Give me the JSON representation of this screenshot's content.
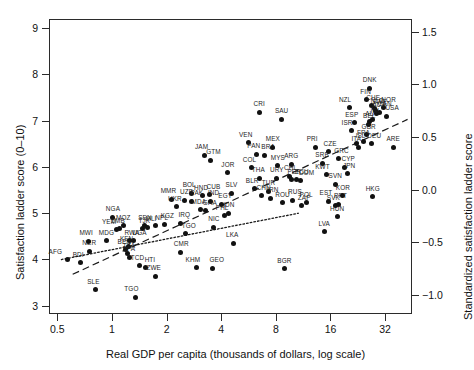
{
  "chart_data": {
    "type": "scatter",
    "title": "",
    "xlabel": "Real GDP per capita (thousands of dollars, log scale)",
    "ylabel": "Satisfaction ladder score (0–10)",
    "ylabel_right": "Standardized satisfaction ladder score",
    "x_scale": "log2",
    "xlim": [
      0.45,
      45
    ],
    "ylim": [
      2.82,
      9.2
    ],
    "ylim_right": [
      -1.18,
      1.62
    ],
    "xticks": [
      0.5,
      1,
      2,
      4,
      8,
      16,
      32
    ],
    "xtick_labels": [
      "0.5",
      "1",
      "2",
      "4",
      "8",
      "16",
      "32"
    ],
    "yticks": [
      3,
      4,
      5,
      6,
      7,
      8,
      9
    ],
    "ytick_labels": [
      "3",
      "4",
      "5",
      "6",
      "7",
      "8",
      "9"
    ],
    "yticks_right": [
      -1.0,
      -0.5,
      0.0,
      0.5,
      1.0,
      1.5
    ],
    "ytick_labels_right": [
      "−1.0",
      "−0.5",
      "0.0",
      "0.5",
      "1.0",
      "1.5"
    ],
    "grid": false,
    "legend": "none",
    "marker": {
      "shape": "circle",
      "color": "#111111",
      "size": 5
    },
    "fit_lines": [
      {
        "name": "dashed-fit",
        "style": "dashed",
        "x0": 0.6,
        "y0": 3.7,
        "x1": 42.0,
        "y1": 7.05
      },
      {
        "name": "dotted-fit",
        "style": "dotted",
        "x0": 0.52,
        "y0": 4.02,
        "x1": 10.5,
        "y1": 5.02
      }
    ],
    "points": [
      {
        "label": "AFG",
        "x": 0.56,
        "y": 4.02,
        "lx": -12,
        "ly": -5
      },
      {
        "label": "BDI",
        "x": 0.66,
        "y": 3.95,
        "lx": -2,
        "ly": -5
      },
      {
        "label": "NER",
        "x": 0.74,
        "y": 4.2,
        "lx": 0,
        "ly": -5
      },
      {
        "label": "MWI",
        "x": 0.73,
        "y": 4.42,
        "lx": -2,
        "ly": -5
      },
      {
        "label": "SLE",
        "x": 0.8,
        "y": 3.37,
        "lx": -2,
        "ly": -5
      },
      {
        "label": "MDG",
        "x": 0.92,
        "y": 4.43,
        "lx": 0,
        "ly": -5
      },
      {
        "label": "ZWE",
        "x": 1.72,
        "y": 3.66,
        "lx": -2,
        "ly": -5
      },
      {
        "label": "TGO",
        "x": 1.33,
        "y": 3.2,
        "lx": -4,
        "ly": -5
      },
      {
        "label": "MOZ",
        "x": 1.14,
        "y": 4.75,
        "lx": 0,
        "ly": -5
      },
      {
        "label": "NGA",
        "x": 1.0,
        "y": 4.93,
        "lx": 0,
        "ly": -5
      },
      {
        "label": "ZMB",
        "x": 1.08,
        "y": 4.68,
        "lx": -1,
        "ly": -5
      },
      {
        "label": "YEM",
        "x": 1.04,
        "y": 4.66,
        "lx": -7,
        "ly": -5
      },
      {
        "label": "RWA",
        "x": 1.24,
        "y": 4.43,
        "lx": 2,
        "ly": -5
      },
      {
        "label": "UGA",
        "x": 1.3,
        "y": 4.43,
        "lx": 6,
        "ly": -5
      },
      {
        "label": "KEN",
        "x": 1.22,
        "y": 4.3,
        "lx": -2,
        "ly": -5
      },
      {
        "label": "BEN",
        "x": 1.17,
        "y": 4.23,
        "lx": -1,
        "ly": -5
      },
      {
        "label": "TZA",
        "x": 1.21,
        "y": 4.15,
        "lx": 1,
        "ly": -5
      },
      {
        "label": "BFA",
        "x": 1.24,
        "y": 4.07,
        "lx": -1,
        "ly": -5
      },
      {
        "label": "TCD",
        "x": 1.4,
        "y": 3.88,
        "lx": -2,
        "ly": -5
      },
      {
        "label": "HTI",
        "x": 1.52,
        "y": 3.84,
        "lx": 4,
        "ly": -5
      },
      {
        "label": "SEN",
        "x": 1.5,
        "y": 4.75,
        "lx": 0,
        "ly": -5
      },
      {
        "label": "MLI",
        "x": 1.56,
        "y": 4.72,
        "lx": 3,
        "ly": -5
      },
      {
        "label": "JAM",
        "x": 3.2,
        "y": 6.28,
        "lx": -3,
        "ly": -5
      },
      {
        "label": "GTM",
        "x": 3.45,
        "y": 6.17,
        "lx": 3,
        "ly": -5
      },
      {
        "label": "JOR",
        "x": 4.3,
        "y": 5.9,
        "lx": 0,
        "ly": -5
      },
      {
        "label": "BOL",
        "x": 2.7,
        "y": 5.45,
        "lx": -2,
        "ly": -5
      },
      {
        "label": "CUB",
        "x": 3.4,
        "y": 5.42,
        "lx": 4,
        "ly": -5
      },
      {
        "label": "HND",
        "x": 3.1,
        "y": 5.4,
        "lx": -1,
        "ly": -5
      },
      {
        "label": "SLV",
        "x": 4.5,
        "y": 5.45,
        "lx": 0,
        "ly": -5
      },
      {
        "label": "MMR",
        "x": 2.1,
        "y": 5.32,
        "lx": -3,
        "ly": -5
      },
      {
        "label": "UZB",
        "x": 2.48,
        "y": 5.3,
        "lx": 2,
        "ly": -5
      },
      {
        "label": "PAK",
        "x": 2.72,
        "y": 5.28,
        "lx": 5,
        "ly": -5
      },
      {
        "label": "UKR",
        "x": 2.25,
        "y": 5.16,
        "lx": -2,
        "ly": -5
      },
      {
        "label": "IND",
        "x": 3.45,
        "y": 5.28,
        "lx": 3,
        "ly": -5
      },
      {
        "label": "EGY",
        "x": 3.95,
        "y": 5.22,
        "lx": 4,
        "ly": -5
      },
      {
        "label": "MDA",
        "x": 3.05,
        "y": 5.1,
        "lx": -2,
        "ly": -5
      },
      {
        "label": "GHA",
        "x": 3.25,
        "y": 5.08,
        "lx": 4,
        "ly": -5
      },
      {
        "label": "IDN",
        "x": 4.35,
        "y": 5.02,
        "lx": 0,
        "ly": -5
      },
      {
        "label": "PHL",
        "x": 4.1,
        "y": 4.97,
        "lx": -2,
        "ly": -5
      },
      {
        "label": "NIC",
        "x": 3.6,
        "y": 4.72,
        "lx": 0,
        "ly": -5
      },
      {
        "label": "IRQ",
        "x": 2.35,
        "y": 4.8,
        "lx": 4,
        "ly": -5
      },
      {
        "label": "NPL",
        "x": 1.72,
        "y": 4.75,
        "lx": 6,
        "ly": -5
      },
      {
        "label": "KGZ",
        "x": 1.92,
        "y": 4.78,
        "lx": 3,
        "ly": -5
      },
      {
        "label": "TJK",
        "x": 1.45,
        "y": 4.68,
        "lx": 2,
        "ly": -5
      },
      {
        "label": "TGO2",
        "x": 2.52,
        "y": 4.58,
        "lx": 3,
        "ly": -5
      },
      {
        "label": "CMR",
        "x": 2.35,
        "y": 4.18,
        "lx": 1,
        "ly": -5
      },
      {
        "label": "KHM",
        "x": 2.9,
        "y": 3.84,
        "lx": -4,
        "ly": -5
      },
      {
        "label": "GEO",
        "x": 3.55,
        "y": 3.83,
        "lx": 4,
        "ly": -5
      },
      {
        "label": "LKA",
        "x": 4.6,
        "y": 4.37,
        "lx": -1,
        "ly": -5
      },
      {
        "label": "VEN",
        "x": 5.6,
        "y": 6.55,
        "lx": -3,
        "ly": -5
      },
      {
        "label": "PAN",
        "x": 6.2,
        "y": 6.3,
        "lx": -3,
        "ly": -5
      },
      {
        "label": "BRA",
        "x": 6.8,
        "y": 6.28,
        "lx": 4,
        "ly": -5
      },
      {
        "label": "MEX",
        "x": 7.6,
        "y": 6.45,
        "lx": 0,
        "ly": -5
      },
      {
        "label": "CRI",
        "x": 6.4,
        "y": 7.2,
        "lx": 0,
        "ly": -5
      },
      {
        "label": "SAU",
        "x": 8.5,
        "y": 7.05,
        "lx": 0,
        "ly": -5
      },
      {
        "label": "COL",
        "x": 5.8,
        "y": 6.0,
        "lx": -2,
        "ly": -5
      },
      {
        "label": "MYS",
        "x": 8.1,
        "y": 6.05,
        "lx": 0,
        "ly": -5
      },
      {
        "label": "ARG",
        "x": 9.6,
        "y": 6.08,
        "lx": 0,
        "ly": -5
      },
      {
        "label": "THA",
        "x": 6.4,
        "y": 5.78,
        "lx": -1,
        "ly": -5
      },
      {
        "label": "URY",
        "x": 8.0,
        "y": 5.78,
        "lx": 0,
        "ly": -5
      },
      {
        "label": "CHL",
        "x": 9.4,
        "y": 5.82,
        "lx": 1,
        "ly": -5
      },
      {
        "label": "PER",
        "x": 9.6,
        "y": 5.75,
        "lx": 3,
        "ly": -5
      },
      {
        "label": "ECU",
        "x": 10.3,
        "y": 5.75,
        "lx": 5,
        "ly": -5
      },
      {
        "label": "DOM",
        "x": 10.8,
        "y": 5.72,
        "lx": 6,
        "ly": -5
      },
      {
        "label": "BLR",
        "x": 6.0,
        "y": 5.55,
        "lx": -2,
        "ly": -5
      },
      {
        "label": "TUR",
        "x": 7.2,
        "y": 5.5,
        "lx": 0,
        "ly": -5
      },
      {
        "label": "CHN",
        "x": 6.6,
        "y": 5.4,
        "lx": 2,
        "ly": -5
      },
      {
        "label": "IRN",
        "x": 7.4,
        "y": 5.35,
        "lx": 2,
        "ly": -5
      },
      {
        "label": "RUS",
        "x": 9.8,
        "y": 5.3,
        "lx": 2,
        "ly": -5
      },
      {
        "label": "ROU",
        "x": 8.6,
        "y": 5.25,
        "lx": 0,
        "ly": -5
      },
      {
        "label": "POL",
        "x": 11.6,
        "y": 5.25,
        "lx": 0,
        "ly": -5
      },
      {
        "label": "ZAF",
        "x": 11.0,
        "y": 5.18,
        "lx": 2,
        "ly": -5
      },
      {
        "label": "LVA",
        "x": 14.6,
        "y": 4.62,
        "lx": 0,
        "ly": -5
      },
      {
        "label": "SVK",
        "x": 16.8,
        "y": 5.18,
        "lx": -2,
        "ly": -5
      },
      {
        "label": "EST",
        "x": 15.5,
        "y": 5.28,
        "lx": -3,
        "ly": -5
      },
      {
        "label": "PRT",
        "x": 17.5,
        "y": 5.22,
        "lx": 2,
        "ly": -5
      },
      {
        "label": "HUN",
        "x": 17.2,
        "y": 4.95,
        "lx": 0,
        "ly": -5
      },
      {
        "label": "BGR",
        "x": 8.8,
        "y": 3.82,
        "lx": 0,
        "ly": -5
      },
      {
        "label": "PRI",
        "x": 13.0,
        "y": 6.45,
        "lx": -3,
        "ly": -5
      },
      {
        "label": "CZE",
        "x": 15.5,
        "y": 6.35,
        "lx": 1,
        "ly": -5
      },
      {
        "label": "SRB",
        "x": 14.2,
        "y": 6.1,
        "lx": 0,
        "ly": -5
      },
      {
        "label": "GRC",
        "x": 17.5,
        "y": 6.2,
        "lx": 3,
        "ly": -5
      },
      {
        "label": "CYP",
        "x": 18.8,
        "y": 6.02,
        "lx": 4,
        "ly": -5
      },
      {
        "label": "KWT",
        "x": 15.0,
        "y": 5.85,
        "lx": -4,
        "ly": -5
      },
      {
        "label": "JPN",
        "x": 19.5,
        "y": 5.88,
        "lx": 2,
        "ly": -5
      },
      {
        "label": "SVN",
        "x": 16.8,
        "y": 5.65,
        "lx": 0,
        "ly": -5
      },
      {
        "label": "KOR",
        "x": 18.5,
        "y": 5.4,
        "lx": 0,
        "ly": -5
      },
      {
        "label": "HKG",
        "x": 27.0,
        "y": 5.38,
        "lx": 0,
        "ly": -5
      },
      {
        "label": "ARE",
        "x": 35.0,
        "y": 6.45,
        "lx": 0,
        "ly": -5
      },
      {
        "label": "DNK",
        "x": 26.0,
        "y": 7.72,
        "lx": 0,
        "ly": -5
      },
      {
        "label": "FIN",
        "x": 25.0,
        "y": 7.48,
        "lx": -1,
        "ly": -5
      },
      {
        "label": "NZL",
        "x": 20.0,
        "y": 7.3,
        "lx": -4,
        "ly": -5
      },
      {
        "label": "CHE",
        "x": 26.5,
        "y": 7.35,
        "lx": 2,
        "ly": -5
      },
      {
        "label": "NLD",
        "x": 27.5,
        "y": 7.28,
        "lx": 3,
        "ly": -5
      },
      {
        "label": "SWE",
        "x": 28.0,
        "y": 7.25,
        "lx": 4,
        "ly": -5
      },
      {
        "label": "NOR",
        "x": 31.0,
        "y": 7.3,
        "lx": 5,
        "ly": -5
      },
      {
        "label": "CAN",
        "x": 29.5,
        "y": 7.2,
        "lx": 5,
        "ly": -5
      },
      {
        "label": "AUS",
        "x": 28.5,
        "y": 7.18,
        "lx": 2,
        "ly": -5
      },
      {
        "label": "USA",
        "x": 32.0,
        "y": 7.12,
        "lx": 6,
        "ly": -5
      },
      {
        "label": "IRL",
        "x": 27.0,
        "y": 7.05,
        "lx": 3,
        "ly": -5
      },
      {
        "label": "AUT",
        "x": 26.0,
        "y": 7.0,
        "lx": 2,
        "ly": -5
      },
      {
        "label": "BEL",
        "x": 25.5,
        "y": 6.95,
        "lx": 1,
        "ly": -5
      },
      {
        "label": "ESP",
        "x": 21.5,
        "y": 6.98,
        "lx": -3,
        "ly": -5
      },
      {
        "label": "ISR",
        "x": 20.5,
        "y": 6.8,
        "lx": -4,
        "ly": -5
      },
      {
        "label": "GBR",
        "x": 25.0,
        "y": 6.72,
        "lx": 2,
        "ly": -5
      },
      {
        "label": "FRA",
        "x": 24.0,
        "y": 6.58,
        "lx": 0,
        "ly": -5
      },
      {
        "label": "DEU",
        "x": 26.5,
        "y": 6.52,
        "lx": 3,
        "ly": -5
      },
      {
        "label": "ITA",
        "x": 22.5,
        "y": 6.45,
        "lx": -2,
        "ly": -5
      },
      {
        "label": "ISL",
        "x": 22.0,
        "y": 6.52,
        "lx": 4,
        "ly": -5
      }
    ]
  }
}
